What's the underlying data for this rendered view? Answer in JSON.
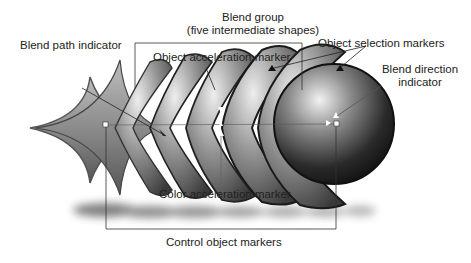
{
  "diagram": {
    "labels": {
      "blend_group_line1": "Blend group",
      "blend_group_line2": "(five intermediate shapes)",
      "blend_path_indicator": "Blend path indicator",
      "object_acceleration_marker": "Object acceleration marker",
      "object_selection_markers": "Object selection markers",
      "blend_direction_line1": "Blend direction",
      "blend_direction_line2": "indicator",
      "color_acceleration_marker": "Color acceleration marker",
      "control_object_markers": "Control object markers"
    },
    "shapes": {
      "start_control_object": "concave star (astroid) shape",
      "end_control_object": "sphere",
      "intermediate_count": 5
    },
    "colors": {
      "line": "#333333",
      "text": "#222222",
      "shape_dark": "#1a1a1a",
      "shape_light": "#e6e6e6",
      "background": "#ffffff"
    }
  }
}
